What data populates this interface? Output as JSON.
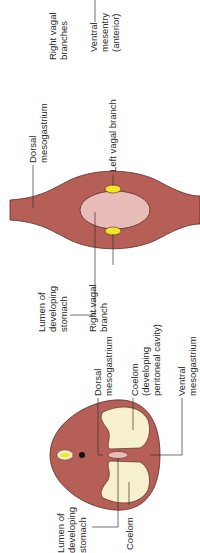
{
  "colors": {
    "tissue": "#b65f56",
    "tissue_outline": "#5a2a25",
    "lumen": "#e8bcb8",
    "coelom": "#f6f0cc",
    "nerve": "#f2e62a",
    "leader": "#333333"
  },
  "orientation": "rotated -90deg",
  "panels": {
    "mesentery_view": {
      "labels": {
        "right_vagal_branches": [
          "Right vagal",
          "branches"
        ],
        "ventral_mesentry": [
          "Ventral",
          "mesentry",
          "(anterior)"
        ],
        "dorsal_mesogastrium": [
          "Dorsal",
          "mesogastrium"
        ],
        "left_vagal_branch": [
          "Left vagal branch"
        ],
        "lumen": [
          "Lumen of",
          "developing",
          "stomach"
        ],
        "right_vagal_branch": [
          "Right vagal",
          "branch"
        ]
      }
    },
    "cross_section": {
      "labels": {
        "dorsal_mesogastrium": [
          "Dorsal",
          "mesogastrium"
        ],
        "coelom_cavity": [
          "Coelom",
          "(developing",
          "peritoneal cavity)"
        ],
        "ventral_mesogastrium": [
          "Ventral",
          "mesogastrium"
        ],
        "lumen": [
          "Lumen of",
          "developing",
          "stomach"
        ],
        "coelom": [
          "Coelom"
        ]
      }
    }
  }
}
